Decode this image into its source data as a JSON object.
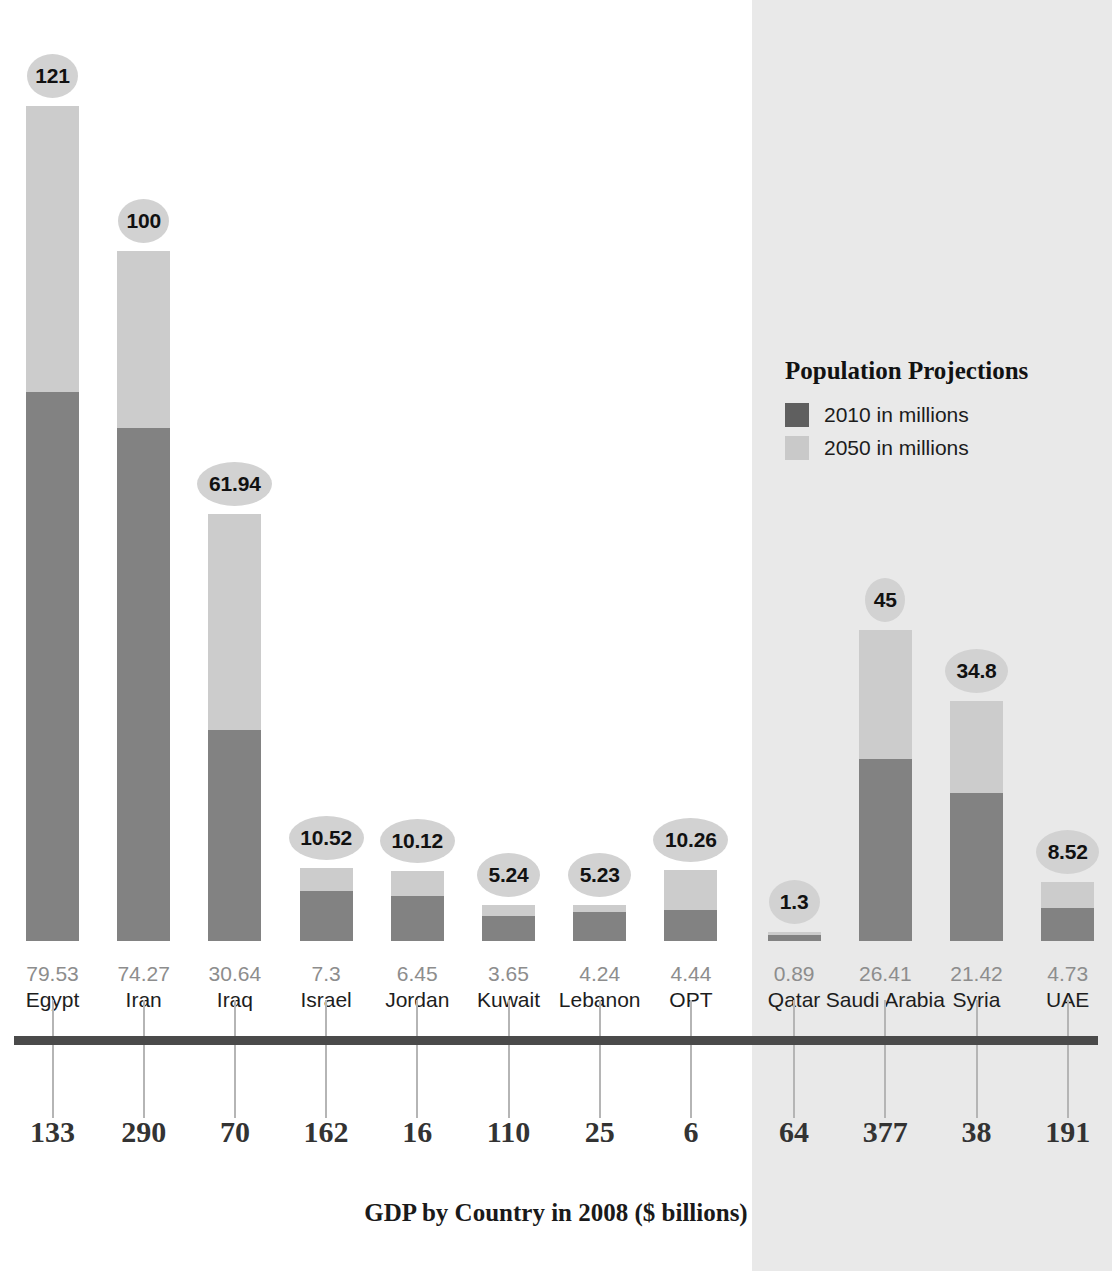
{
  "chart_data": {
    "type": "bar",
    "title": "GDP by Country in 2008 ($ billions)",
    "subtitle": "",
    "xlabel": "",
    "ylabel": "",
    "grid": false,
    "legend_position": "right",
    "legend": {
      "title": "Population Projections",
      "entries": [
        {
          "name": "2010 in millions",
          "color": "#5f5f5f"
        },
        {
          "name": "2050 in millions",
          "color": "#c9c9c9"
        }
      ]
    },
    "categories": [
      "Egypt",
      "Iran",
      "Iraq",
      "Israel",
      "Jordan",
      "Kuwait",
      "Lebanon",
      "OPT",
      "Qatar",
      "Saudi Arabia",
      "Syria",
      "UAE"
    ],
    "series": [
      {
        "name": "2010 in millions",
        "values": [
          79.53,
          74.27,
          30.64,
          7.3,
          6.45,
          3.65,
          4.24,
          4.44,
          0.89,
          26.41,
          21.42,
          4.73
        ]
      },
      {
        "name": "2050 in millions",
        "values": [
          121,
          100,
          61.94,
          10.52,
          10.12,
          5.24,
          5.23,
          10.26,
          1.3,
          45,
          34.8,
          8.52
        ]
      },
      {
        "name": "GDP by Country in 2008 ($ billions)",
        "values": [
          133,
          290,
          70,
          162,
          16,
          110,
          25,
          6,
          64,
          377,
          38,
          191
        ]
      }
    ],
    "ylim": [
      0,
      121
    ]
  },
  "legend": {
    "title": "Population Projections",
    "item_2010": "2010 in millions",
    "item_2050": "2050 in millions"
  },
  "axis": {
    "title": "GDP by Country in 2008 ($ billions)"
  },
  "colors": {
    "bar_2010": "#828282",
    "bar_2050": "#cccccc",
    "bubble": "#d2d2d2",
    "axis_line": "#4a4a4a",
    "tick": "#b5b5b5",
    "shade_panel": "#e9e9e9",
    "pop_value_text": "#8d8d8d",
    "country_text": "#1d1d1d",
    "gdp_text": "#333333"
  },
  "bars": [
    {
      "country": "Egypt",
      "pop2010": "79.53",
      "pop2050": "121",
      "gdp": "133",
      "v2010": 79.53,
      "v2050": 121,
      "shaded": false
    },
    {
      "country": "Iran",
      "pop2010": "74.27",
      "pop2050": "100",
      "gdp": "290",
      "v2010": 74.27,
      "v2050": 100,
      "shaded": false
    },
    {
      "country": "Iraq",
      "pop2010": "30.64",
      "pop2050": "61.94",
      "gdp": "70",
      "v2010": 30.64,
      "v2050": 61.94,
      "shaded": false
    },
    {
      "country": "Israel",
      "pop2010": "7.3",
      "pop2050": "10.52",
      "gdp": "162",
      "v2010": 7.3,
      "v2050": 10.52,
      "shaded": false
    },
    {
      "country": "Jordan",
      "pop2010": "6.45",
      "pop2050": "10.12",
      "gdp": "16",
      "v2010": 6.45,
      "v2050": 10.12,
      "shaded": false
    },
    {
      "country": "Kuwait",
      "pop2010": "3.65",
      "pop2050": "5.24",
      "gdp": "110",
      "v2010": 3.65,
      "v2050": 5.24,
      "shaded": false
    },
    {
      "country": "Lebanon",
      "pop2010": "4.24",
      "pop2050": "5.23",
      "gdp": "25",
      "v2010": 4.24,
      "v2050": 5.23,
      "shaded": false
    },
    {
      "country": "OPT",
      "pop2010": "4.44",
      "pop2050": "10.26",
      "gdp": "6",
      "v2010": 4.44,
      "v2050": 10.26,
      "shaded": false
    },
    {
      "country": "Qatar",
      "pop2010": "0.89",
      "pop2050": "1.3",
      "gdp": "64",
      "v2010": 0.89,
      "v2050": 1.3,
      "shaded": true
    },
    {
      "country": "Saudi Arabia",
      "pop2010": "26.41",
      "pop2050": "45",
      "gdp": "377",
      "v2010": 26.41,
      "v2050": 45,
      "shaded": true
    },
    {
      "country": "Syria",
      "pop2010": "21.42",
      "pop2050": "34.8",
      "gdp": "38",
      "v2010": 21.42,
      "v2050": 34.8,
      "shaded": true
    },
    {
      "country": "UAE",
      "pop2010": "4.73",
      "pop2050": "8.52",
      "gdp": "191",
      "v2010": 4.73,
      "v2050": 8.52,
      "shaded": true
    }
  ]
}
